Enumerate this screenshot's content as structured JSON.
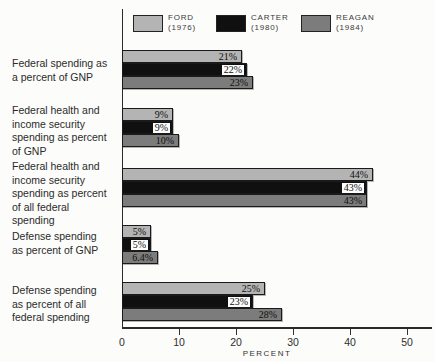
{
  "colors": {
    "background": "#fcfcfa",
    "axis": "#2a2a2a",
    "ford_bar": "#b4b4b4",
    "carter_bar": "#101010",
    "reagan_bar": "#7c7c7c"
  },
  "chart_data": {
    "type": "bar",
    "orientation": "horizontal",
    "title": "",
    "xlabel": "PERCENT",
    "xlim": [
      0,
      50
    ],
    "xticks": [
      0,
      10,
      20,
      30,
      40,
      50
    ],
    "legend_position": "top",
    "grid": false,
    "categories": [
      "Federal spending as\na percent of GNP",
      "Federal health and\nincome security\nspending as percent\nof GNP",
      "Federal health and\nincome security\nspending as percent\nof all federal\nspending",
      "Defense spending\nas percent of GNP",
      "Defense spending\nas percent of all\nfederal spending"
    ],
    "series": [
      {
        "name": "FORD",
        "year": "(1976)",
        "color": "#b4b4b4",
        "values": [
          21,
          9,
          44,
          5,
          25
        ],
        "labels": [
          "21%",
          "9%",
          "44%",
          "5%",
          "25%"
        ]
      },
      {
        "name": "CARTER",
        "year": "(1980)",
        "color": "#101010",
        "values": [
          22,
          9,
          43,
          5,
          23
        ],
        "labels": [
          "22%",
          "9%",
          "43%",
          "5%",
          "23%"
        ]
      },
      {
        "name": "REAGAN",
        "year": "(1984)",
        "color": "#7c7c7c",
        "values": [
          23,
          10,
          43,
          6.4,
          28
        ],
        "labels": [
          "23%",
          "10%",
          "43%",
          "6.4%",
          "28%"
        ]
      }
    ]
  }
}
